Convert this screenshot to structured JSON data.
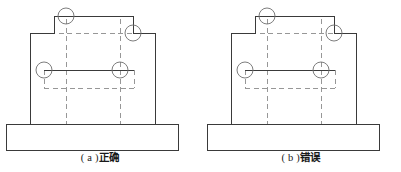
{
  "page": {
    "background_color": "#ffffff",
    "line_color": "#3a3a3a",
    "hidden_line_color": "#8c8c8c",
    "text_color": "#1a1a1a",
    "width": 401,
    "height": 172
  },
  "figures": [
    {
      "id": "figure-a",
      "caption_label": "( a )",
      "caption_text": "正确",
      "caption_full": "( a ) 正确",
      "drawing_type": "engineering-part-front-view",
      "outline_points": "30,33 54,33 54,16 133,16 133,33 155,33 155,124 30,124",
      "base_rect": {
        "x": 6,
        "y": 124,
        "width": 172,
        "height": 26
      },
      "hidden_lines": {
        "horizontal": [
          {
            "x1": 33,
            "y1": 33,
            "x2": 152,
            "y2": 33
          },
          {
            "x1": 44,
            "y1": 70,
            "x2": 134,
            "y2": 70
          },
          {
            "x1": 44,
            "y1": 88,
            "x2": 134,
            "y2": 88
          }
        ],
        "vertical": [
          {
            "x1": 66,
            "y1": 19,
            "x2": 66,
            "y2": 124
          },
          {
            "x1": 120,
            "y1": 19,
            "x2": 120,
            "y2": 124
          },
          {
            "x1": 44,
            "y1": 70,
            "x2": 44,
            "y2": 88
          },
          {
            "x1": 134,
            "y1": 70,
            "x2": 134,
            "y2": 88
          }
        ]
      },
      "solid_inner_lines": [
        {
          "x1": 44,
          "y1": 70,
          "x2": 134,
          "y2": 70
        }
      ],
      "callout_circles": [
        {
          "cx": 66,
          "cy": 16,
          "r": 8,
          "label": "top-step-corner"
        },
        {
          "cx": 133,
          "cy": 33,
          "r": 8,
          "label": "right-step-corner"
        },
        {
          "cx": 44,
          "cy": 70,
          "r": 8,
          "label": "left-slot-corner"
        },
        {
          "cx": 120,
          "cy": 70,
          "r": 8,
          "label": "right-slot-corner"
        }
      ]
    },
    {
      "id": "figure-b",
      "caption_label": "( b )",
      "caption_text": "错误",
      "caption_full": "( b ) 错误",
      "drawing_type": "engineering-part-front-view",
      "outline_points": "30,33 54,33 54,16 133,16 133,33 155,33 155,124 30,124",
      "base_rect": {
        "x": 6,
        "y": 124,
        "width": 172,
        "height": 26
      },
      "hidden_lines": {
        "horizontal": [
          {
            "x1": 33,
            "y1": 33,
            "x2": 152,
            "y2": 33
          },
          {
            "x1": 44,
            "y1": 70,
            "x2": 134,
            "y2": 70
          },
          {
            "x1": 44,
            "y1": 88,
            "x2": 134,
            "y2": 88
          }
        ],
        "vertical": [
          {
            "x1": 66,
            "y1": 19,
            "x2": 66,
            "y2": 124
          },
          {
            "x1": 120,
            "y1": 19,
            "x2": 120,
            "y2": 124
          },
          {
            "x1": 44,
            "y1": 70,
            "x2": 44,
            "y2": 88
          },
          {
            "x1": 134,
            "y1": 70,
            "x2": 134,
            "y2": 88
          }
        ]
      },
      "solid_inner_lines": [
        {
          "x1": 44,
          "y1": 70,
          "x2": 134,
          "y2": 70
        }
      ],
      "callout_circles": [
        {
          "cx": 66,
          "cy": 16,
          "r": 8,
          "label": "top-step-corner"
        },
        {
          "cx": 133,
          "cy": 33,
          "r": 8,
          "label": "right-step-corner"
        },
        {
          "cx": 44,
          "cy": 70,
          "r": 8,
          "label": "left-slot-corner"
        },
        {
          "cx": 120,
          "cy": 70,
          "r": 8,
          "label": "right-slot-corner"
        }
      ]
    }
  ]
}
